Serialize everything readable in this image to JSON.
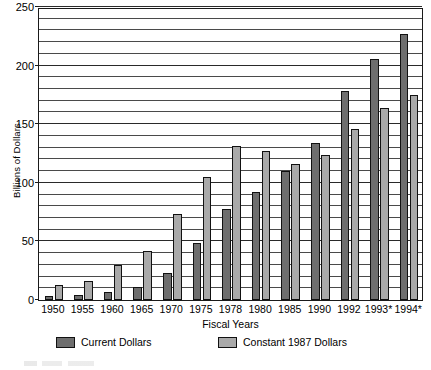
{
  "chart_data": {
    "type": "bar",
    "title": "",
    "xlabel": "Fiscal Years",
    "ylabel": "Billions of Dollars",
    "ylim": [
      0,
      250
    ],
    "ytick_step": 50,
    "gridline_step": 10,
    "grid": true,
    "legend_position": "bottom",
    "categories": [
      "1950",
      "1955",
      "1960",
      "1965",
      "1970",
      "1975",
      "1978",
      "1980",
      "1985",
      "1990",
      "1992",
      "1993*",
      "1994*"
    ],
    "yticks": [
      "250",
      "200",
      "150",
      "100",
      "50",
      "0"
    ],
    "series": [
      {
        "name": "Current Dollars",
        "color": "#6e6e6e",
        "values": [
          3,
          4,
          7,
          11,
          23,
          49,
          78,
          92,
          110,
          134,
          178,
          206,
          227
        ]
      },
      {
        "name": "Constant 1987 Dollars",
        "color": "#a9a9a9",
        "values": [
          13,
          16,
          30,
          42,
          73,
          105,
          131,
          127,
          116,
          124,
          146,
          164,
          175
        ]
      }
    ]
  },
  "legend": {
    "items": [
      {
        "label": "Current Dollars"
      },
      {
        "label": "Constant 1987 Dollars"
      }
    ]
  }
}
